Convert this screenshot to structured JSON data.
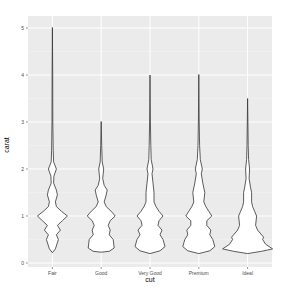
{
  "chart_data": {
    "type": "violin",
    "title": "",
    "xlabel": "cut",
    "ylabel": "carat",
    "categories": [
      "Fair",
      "Good",
      "Very Good",
      "Premium",
      "Ideal"
    ],
    "y_ticks": [
      0,
      1,
      2,
      3,
      4,
      5
    ],
    "ylim": [
      -0.08,
      5.2
    ],
    "grid": true,
    "legend": null,
    "series": [
      {
        "name": "Fair",
        "range": [
          0.22,
          5.01
        ],
        "profile": [
          [
            0.22,
            0.0
          ],
          [
            0.3,
            3
          ],
          [
            0.5,
            6
          ],
          [
            0.6,
            4
          ],
          [
            0.7,
            8
          ],
          [
            0.8,
            5
          ],
          [
            0.9,
            10
          ],
          [
            1.0,
            15
          ],
          [
            1.1,
            9
          ],
          [
            1.2,
            4
          ],
          [
            1.3,
            3
          ],
          [
            1.45,
            5
          ],
          [
            1.55,
            4
          ],
          [
            1.7,
            1.2
          ],
          [
            1.85,
            1.5
          ],
          [
            2.0,
            4
          ],
          [
            2.15,
            1.2
          ],
          [
            2.4,
            0.8
          ],
          [
            3.0,
            0.4
          ],
          [
            4.0,
            0.3
          ],
          [
            5.01,
            0.0
          ]
        ]
      },
      {
        "name": "Good",
        "range": [
          0.23,
          3.01
        ],
        "profile": [
          [
            0.23,
            0
          ],
          [
            0.25,
            8
          ],
          [
            0.32,
            13
          ],
          [
            0.5,
            12
          ],
          [
            0.6,
            8
          ],
          [
            0.7,
            9
          ],
          [
            0.8,
            7
          ],
          [
            0.9,
            9
          ],
          [
            1.0,
            14
          ],
          [
            1.1,
            10
          ],
          [
            1.2,
            5
          ],
          [
            1.3,
            3
          ],
          [
            1.45,
            5
          ],
          [
            1.55,
            6
          ],
          [
            1.65,
            3
          ],
          [
            1.8,
            1.5
          ],
          [
            2.0,
            2.5
          ],
          [
            2.15,
            1
          ],
          [
            2.5,
            0.5
          ],
          [
            3.01,
            0
          ]
        ]
      },
      {
        "name": "Very Good",
        "range": [
          0.2,
          4.0
        ],
        "profile": [
          [
            0.2,
            0
          ],
          [
            0.26,
            10
          ],
          [
            0.35,
            15
          ],
          [
            0.5,
            13
          ],
          [
            0.6,
            10
          ],
          [
            0.7,
            12
          ],
          [
            0.8,
            8
          ],
          [
            0.9,
            9
          ],
          [
            1.0,
            13
          ],
          [
            1.1,
            9
          ],
          [
            1.2,
            6
          ],
          [
            1.3,
            4
          ],
          [
            1.5,
            4
          ],
          [
            1.7,
            3
          ],
          [
            1.9,
            2
          ],
          [
            2.0,
            3
          ],
          [
            2.2,
            1.2
          ],
          [
            2.5,
            0.8
          ],
          [
            3.0,
            0.4
          ],
          [
            4.0,
            0
          ]
        ]
      },
      {
        "name": "Premium",
        "range": [
          0.2,
          4.01
        ],
        "profile": [
          [
            0.2,
            0
          ],
          [
            0.26,
            11
          ],
          [
            0.35,
            16
          ],
          [
            0.5,
            14
          ],
          [
            0.6,
            11
          ],
          [
            0.7,
            12
          ],
          [
            0.8,
            8
          ],
          [
            0.9,
            8
          ],
          [
            1.0,
            13
          ],
          [
            1.1,
            10
          ],
          [
            1.2,
            7
          ],
          [
            1.3,
            5
          ],
          [
            1.5,
            6
          ],
          [
            1.7,
            4
          ],
          [
            1.9,
            2.5
          ],
          [
            2.0,
            3.5
          ],
          [
            2.2,
            1.5
          ],
          [
            2.5,
            0.8
          ],
          [
            3.0,
            0.4
          ],
          [
            4.01,
            0
          ]
        ]
      },
      {
        "name": "Ideal",
        "range": [
          0.2,
          3.5
        ],
        "profile": [
          [
            0.2,
            0
          ],
          [
            0.25,
            14
          ],
          [
            0.3,
            25
          ],
          [
            0.4,
            18
          ],
          [
            0.5,
            15
          ],
          [
            0.55,
            16
          ],
          [
            0.7,
            10
          ],
          [
            0.8,
            8
          ],
          [
            1.0,
            9
          ],
          [
            1.1,
            7
          ],
          [
            1.2,
            5
          ],
          [
            1.3,
            4
          ],
          [
            1.5,
            4
          ],
          [
            1.6,
            3
          ],
          [
            1.8,
            1.5
          ],
          [
            2.0,
            2
          ],
          [
            2.2,
            1
          ],
          [
            2.5,
            0.6
          ],
          [
            3.0,
            0.3
          ],
          [
            3.5,
            0
          ]
        ]
      }
    ]
  },
  "colors": {
    "panel_background": "#ebebeb",
    "grid_major": "#ffffff",
    "grid_minor": "#f5f5f5",
    "violin_fill": "#ffffff",
    "violin_stroke": "#333333"
  }
}
